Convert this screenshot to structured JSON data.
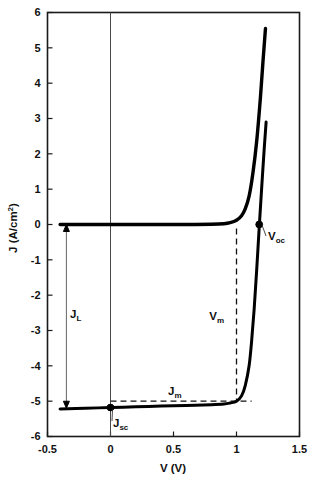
{
  "chart_data": {
    "type": "line",
    "title": "",
    "xlabel": "V (V)",
    "ylabel": "J (A/cm2)",
    "ylabel_parts": {
      "base": "J (A/cm",
      "sup": "2",
      "tail": ")"
    },
    "xlim": [
      -0.5,
      1.5
    ],
    "ylim": [
      -6,
      6
    ],
    "xticks": [
      -0.5,
      0,
      0.5,
      1,
      1.5
    ],
    "xtick_labels": [
      "-0.5",
      "0",
      "0.5",
      "1",
      "1.5"
    ],
    "yticks": [
      6,
      5,
      4,
      3,
      2,
      1,
      0,
      -1,
      -2,
      -3,
      -4,
      -5,
      -6
    ],
    "ytick_labels": [
      "6",
      "5",
      "4",
      "3",
      "2",
      "1",
      "0",
      "-1",
      "-2",
      "-3",
      "-4",
      "-5",
      "-6"
    ],
    "grid": false,
    "legend": "none",
    "series": [
      {
        "name": "dark-diode-curve",
        "style": "solid-thick",
        "points": [
          [
            -0.4,
            0.0
          ],
          [
            -0.2,
            0.0
          ],
          [
            0.0,
            0.0
          ],
          [
            0.2,
            0.0
          ],
          [
            0.4,
            0.0
          ],
          [
            0.6,
            0.0
          ],
          [
            0.8,
            0.005
          ],
          [
            0.9,
            0.02
          ],
          [
            0.95,
            0.05
          ],
          [
            1.0,
            0.12
          ],
          [
            1.04,
            0.25
          ],
          [
            1.07,
            0.45
          ],
          [
            1.1,
            0.8
          ],
          [
            1.13,
            1.45
          ],
          [
            1.16,
            2.35
          ],
          [
            1.19,
            3.6
          ],
          [
            1.21,
            4.6
          ],
          [
            1.23,
            5.55
          ]
        ]
      },
      {
        "name": "illuminated-jv-curve",
        "style": "solid-thick",
        "points": [
          [
            -0.4,
            -5.22
          ],
          [
            -0.2,
            -5.2
          ],
          [
            0.0,
            -5.18
          ],
          [
            0.2,
            -5.16
          ],
          [
            0.4,
            -5.14
          ],
          [
            0.6,
            -5.12
          ],
          [
            0.8,
            -5.1
          ],
          [
            0.9,
            -5.08
          ],
          [
            0.95,
            -5.05
          ],
          [
            1.0,
            -5.0
          ],
          [
            1.04,
            -4.85
          ],
          [
            1.07,
            -4.55
          ],
          [
            1.1,
            -4.0
          ],
          [
            1.12,
            -3.3
          ],
          [
            1.14,
            -2.4
          ],
          [
            1.16,
            -1.3
          ],
          [
            1.18,
            -0.1
          ],
          [
            1.2,
            1.05
          ],
          [
            1.22,
            2.15
          ],
          [
            1.235,
            2.9
          ]
        ]
      }
    ],
    "annotations": [
      {
        "name": "Voc",
        "label": "V",
        "sub": "oc",
        "x": 1.18,
        "y": 0.0,
        "marker": true,
        "desc": "open-circuit voltage"
      },
      {
        "name": "Jsc",
        "label": "J",
        "sub": "sc",
        "x": 0.0,
        "y": -5.18,
        "marker": true,
        "desc": "short-circuit current density"
      },
      {
        "name": "Vm",
        "label": "V",
        "sub": "m",
        "x": 1.0,
        "desc": "maximum-power voltage"
      },
      {
        "name": "Jm",
        "label": "J",
        "sub": "m",
        "y": -5.0,
        "desc": "maximum-power current density"
      },
      {
        "name": "JL",
        "label": "J",
        "sub": "L",
        "from_y": 0.0,
        "to_y": -5.2,
        "at_x": -0.35,
        "desc": "light-generated current density"
      }
    ]
  },
  "axis": {
    "x_title": "V (V)",
    "y_title_base": "J (A/cm",
    "y_title_sup": "2",
    "y_title_tail": ")"
  },
  "labels": {
    "voc_main": "V",
    "voc_sub": "oc",
    "jsc_main": "J",
    "jsc_sub": "sc",
    "vm_main": "V",
    "vm_sub": "m",
    "jm_main": "J",
    "jm_sub": "m",
    "jl_main": "J",
    "jl_sub": "L"
  },
  "ticks": {
    "x": [
      "-0.5",
      "0",
      "0.5",
      "1",
      "1.5"
    ],
    "y": [
      "6",
      "5",
      "4",
      "3",
      "2",
      "1",
      "0",
      "-1",
      "-2",
      "-3",
      "-4",
      "-5",
      "-6"
    ]
  },
  "colors": {
    "curve": "#000000",
    "frame": "#1a1a1a",
    "dashed": "#111111",
    "arrow": "#555555",
    "background": "#ffffff"
  }
}
